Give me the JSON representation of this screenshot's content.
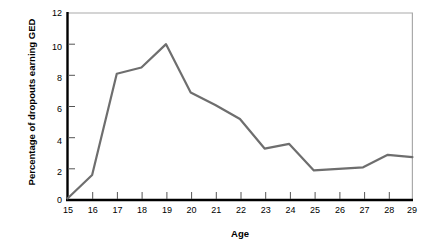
{
  "chart_data": {
    "type": "line",
    "title": "",
    "xlabel": "Age",
    "ylabel": "Percentage of dropouts earning GED",
    "categories": [
      15,
      16,
      17,
      18,
      19,
      20,
      21,
      22,
      23,
      24,
      25,
      26,
      27,
      28,
      29
    ],
    "x": [
      15,
      16,
      17,
      18,
      19,
      20,
      21,
      22,
      23,
      24,
      25,
      26,
      27,
      28,
      29
    ],
    "values": [
      0.1,
      1.6,
      8.1,
      8.5,
      10.0,
      6.9,
      6.1,
      5.2,
      3.3,
      3.6,
      1.9,
      2.0,
      2.1,
      2.9,
      2.75
    ],
    "series": [
      {
        "name": "Percentage of dropouts earning GED",
        "values": [
          0.1,
          1.6,
          8.1,
          8.5,
          10.0,
          6.9,
          6.1,
          5.2,
          3.3,
          3.6,
          1.9,
          2.0,
          2.1,
          2.9,
          2.75
        ],
        "color": "#6e6e6e"
      }
    ],
    "xlim": [
      15,
      29
    ],
    "ylim": [
      0,
      12
    ],
    "xticks": [
      "15",
      "16",
      "17",
      "18",
      "19",
      "20",
      "21",
      "22",
      "23",
      "24",
      "25",
      "26",
      "27",
      "28",
      "29"
    ],
    "yticks": [
      "0",
      "2",
      "4",
      "6",
      "8",
      "10",
      "12"
    ],
    "ytick_values": [
      0,
      2,
      4,
      6,
      8,
      10,
      12
    ],
    "grid": false,
    "legend": "none",
    "line_color": "#6e6e6e",
    "axis_color": "#000000",
    "frame_color": "#aaaaaa",
    "background": "#ffffff"
  }
}
